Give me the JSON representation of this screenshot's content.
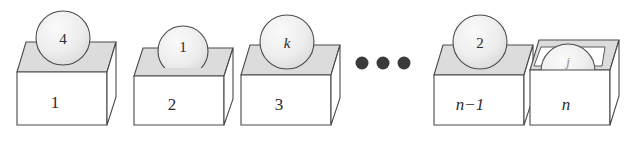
{
  "figure": {
    "background_color": "#ffffff",
    "stroke_color": "#4a4a4a",
    "lid_fill": "#dcdcdc",
    "face_fill": "#ffffff",
    "ball_fill": "#ebebeb",
    "dot_color": "#3a3a3a"
  },
  "boxes": [
    {
      "box_label": "1",
      "box_label_style": "upright",
      "ball_label": "4",
      "ball_label_style": "upright",
      "ball_size": "large",
      "ball_state": "on-top"
    },
    {
      "box_label": "2",
      "box_label_style": "upright",
      "ball_label": "1",
      "ball_label_style": "upright",
      "ball_size": "small",
      "ball_state": "sunk-partly"
    },
    {
      "box_label": "3",
      "box_label_style": "upright",
      "ball_label": "k",
      "ball_label_style": "italic",
      "ball_size": "large",
      "ball_state": "on-top"
    },
    {
      "box_label": "n−1",
      "box_label_style": "italic",
      "ball_label": "2",
      "ball_label_style": "upright",
      "ball_size": "large",
      "ball_state": "on-top"
    },
    {
      "box_label": "n",
      "box_label_style": "italic",
      "ball_label": "j",
      "ball_label_style": "faint-italic",
      "ball_size": "large",
      "ball_state": "inside-open-box"
    }
  ],
  "ellipsis": {
    "symbol": "•••",
    "dot_count": 3,
    "label": "ellipsis-between-box-3-and-box-n-minus-1"
  }
}
